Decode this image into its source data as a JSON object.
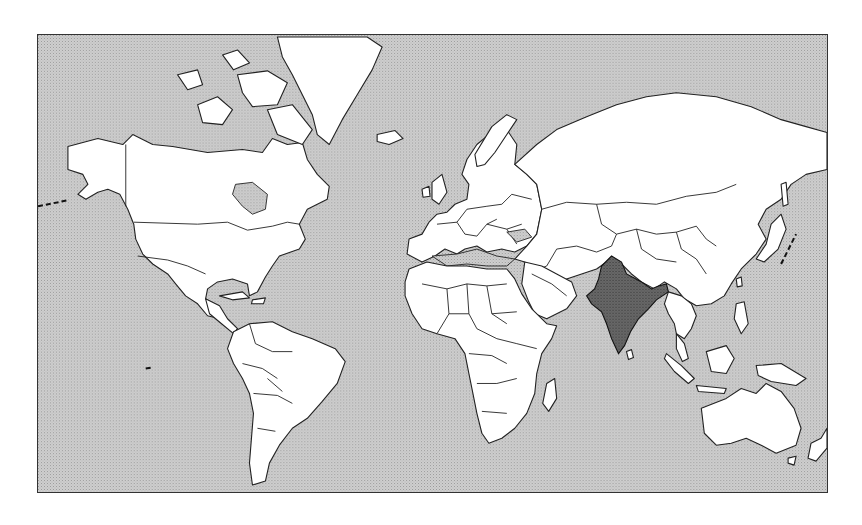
{
  "map": {
    "projection": "mercator",
    "highlighted_country": "India",
    "colors": {
      "ocean": "#c8c8c8",
      "land": "#ffffff",
      "highlight": "#5a5a5a",
      "border": "#222222"
    }
  }
}
